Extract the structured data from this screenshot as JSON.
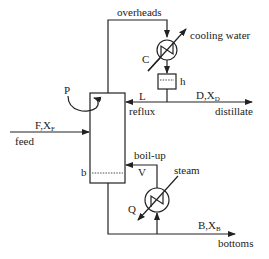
{
  "diagram": {
    "type": "distillation-column-schematic",
    "labels": {
      "overheads": "overheads",
      "cooling_water": "cooling water",
      "condenser": "C",
      "holdup": "h",
      "pressure": "P",
      "reflux_symbol": "L",
      "reflux": "reflux",
      "distillate_symbol": "D,X",
      "distillate_sub": "D",
      "distillate": "distillate",
      "feed_symbol": "F,X",
      "feed_sub": "F",
      "feed": "feed",
      "boilup": "boil-up",
      "vapor_symbol": "V",
      "steam": "steam",
      "reboiler_duty": "Q",
      "bottom_level": "b",
      "bottoms_symbol": "B,X",
      "bottoms_sub": "B",
      "bottoms": "bottoms"
    },
    "colors": {
      "stroke": "#222222",
      "background": "#ffffff"
    }
  }
}
